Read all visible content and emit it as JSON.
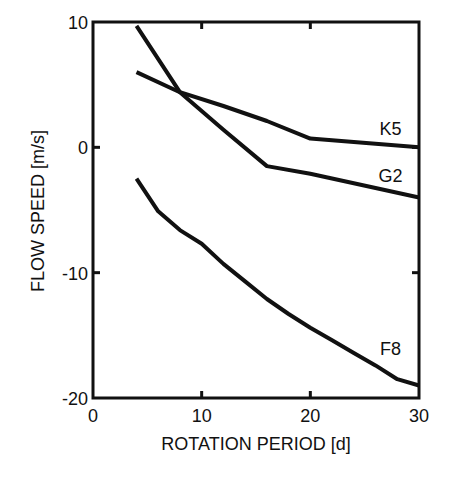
{
  "chart_data": {
    "type": "line",
    "title": "",
    "xlabel": "ROTATION PERIOD [d]",
    "ylabel": "FLOW SPEED [m/s]",
    "xlim": [
      0,
      30
    ],
    "ylim": [
      -20,
      10
    ],
    "xticks": [
      0,
      10,
      20,
      30
    ],
    "yticks": [
      -20,
      -10,
      0,
      10
    ],
    "xtick_labels": [
      "0",
      "10",
      "20",
      "30"
    ],
    "ytick_labels": [
      "-20",
      "-10",
      "0",
      "10"
    ],
    "grid": false,
    "legend": "inline labels at right end of each curve",
    "series": [
      {
        "name": "K5",
        "x": [
          4,
          8,
          12,
          16,
          20,
          30
        ],
        "y": [
          6.0,
          4.4,
          3.3,
          2.1,
          0.7,
          0.0
        ],
        "label_pos": [
          26,
          1.5
        ]
      },
      {
        "name": "G2",
        "x": [
          4,
          8,
          12,
          16,
          20,
          30
        ],
        "y": [
          9.7,
          4.4,
          1.4,
          -1.5,
          -2.1,
          -4.0
        ],
        "label_pos": [
          26,
          -2.3
        ]
      },
      {
        "name": "F8",
        "x": [
          4,
          6,
          8,
          10,
          12,
          14,
          16,
          18,
          20,
          22,
          24,
          26,
          28,
          30
        ],
        "y": [
          -2.5,
          -5.1,
          -6.6,
          -7.7,
          -9.3,
          -10.7,
          -12.1,
          -13.3,
          -14.4,
          -15.4,
          -16.4,
          -17.4,
          -18.5,
          -19.0
        ],
        "label_pos": [
          26,
          -16.1
        ]
      }
    ]
  },
  "colors": {
    "line": "#111111",
    "background": "#ffffff"
  }
}
